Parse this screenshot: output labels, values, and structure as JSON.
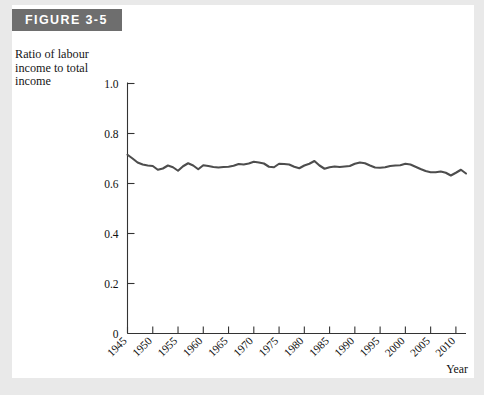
{
  "figure": {
    "banner_label": "FIGURE 3-5",
    "banner_color": "#6e6e6e",
    "card_color": "#ffffff",
    "page_background": "#e9e9e9"
  },
  "chart_data": {
    "type": "line",
    "title": "",
    "subtitle": "",
    "ylabel": "Ratio of labour income to total income",
    "xlabel": "Year",
    "line_color": "#4d4d4d",
    "axis_color": "#333333",
    "grid": false,
    "legend": null,
    "ylim": [
      0,
      1.0
    ],
    "xlim": [
      1945,
      2012
    ],
    "ytick_labels": [
      "0",
      "0.2",
      "0.4",
      "0.6",
      "0.8",
      "1.0"
    ],
    "ytick_values": [
      0,
      0.2,
      0.4,
      0.6,
      0.8,
      1.0
    ],
    "xtick_labels": [
      "1945",
      "1950",
      "1955",
      "1960",
      "1965",
      "1970",
      "1975",
      "1980",
      "1985",
      "1990",
      "1995",
      "2000",
      "2005",
      "2010"
    ],
    "xtick_values": [
      1945,
      1950,
      1955,
      1960,
      1965,
      1970,
      1975,
      1980,
      1985,
      1990,
      1995,
      2000,
      2005,
      2010
    ],
    "x": [
      1945,
      1946,
      1947,
      1948,
      1949,
      1950,
      1951,
      1952,
      1953,
      1954,
      1955,
      1956,
      1957,
      1958,
      1959,
      1960,
      1961,
      1962,
      1963,
      1964,
      1965,
      1966,
      1967,
      1968,
      1969,
      1970,
      1971,
      1972,
      1973,
      1974,
      1975,
      1976,
      1977,
      1978,
      1979,
      1980,
      1981,
      1982,
      1983,
      1984,
      1985,
      1986,
      1987,
      1988,
      1989,
      1990,
      1991,
      1992,
      1993,
      1994,
      1995,
      1996,
      1997,
      1998,
      1999,
      2000,
      2001,
      2002,
      2003,
      2004,
      2005,
      2006,
      2007,
      2008,
      2009,
      2010,
      2011,
      2012
    ],
    "values": [
      0.715,
      0.7,
      0.684,
      0.676,
      0.672,
      0.67,
      0.655,
      0.66,
      0.672,
      0.665,
      0.651,
      0.669,
      0.681,
      0.672,
      0.657,
      0.673,
      0.67,
      0.666,
      0.664,
      0.666,
      0.667,
      0.671,
      0.678,
      0.676,
      0.68,
      0.687,
      0.684,
      0.68,
      0.667,
      0.665,
      0.679,
      0.678,
      0.676,
      0.667,
      0.661,
      0.672,
      0.679,
      0.69,
      0.672,
      0.659,
      0.665,
      0.668,
      0.666,
      0.668,
      0.67,
      0.679,
      0.684,
      0.681,
      0.672,
      0.664,
      0.663,
      0.665,
      0.67,
      0.672,
      0.673,
      0.679,
      0.676,
      0.667,
      0.658,
      0.65,
      0.645,
      0.645,
      0.648,
      0.643,
      0.632,
      0.643,
      0.655,
      0.64
    ]
  }
}
